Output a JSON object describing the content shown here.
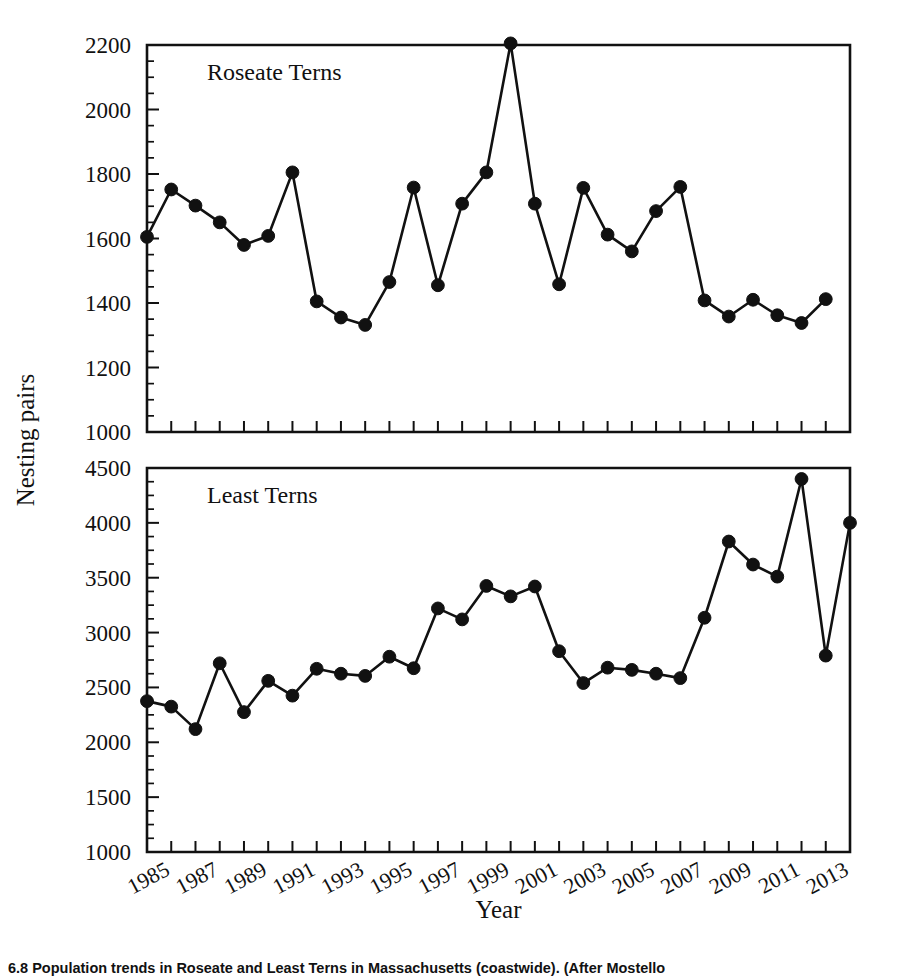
{
  "figure": {
    "xlabel": "Year",
    "ylabel": "Nesting pairs",
    "caption": "6.8   Population trends in Roseate and Least Terns in Massachusetts (coastwide). (After Mostello"
  },
  "chart_data": [
    {
      "type": "line",
      "title": "Roseate Terns",
      "xlabel": "Year",
      "ylabel": "Nesting pairs",
      "xlim": [
        1984,
        2013
      ],
      "ylim": [
        1000,
        2200
      ],
      "ytick_step": 200,
      "yticks": [
        1000,
        1200,
        1400,
        1600,
        1800,
        2000,
        2200
      ],
      "xticks": [
        1985,
        1987,
        1989,
        1991,
        1993,
        1995,
        1997,
        1999,
        2001,
        2003,
        2005,
        2007,
        2009,
        2011,
        2013
      ],
      "grid": false,
      "legend": "none",
      "marker": "filled-circle",
      "x": [
        1984,
        1985,
        1986,
        1987,
        1988,
        1989,
        1990,
        1991,
        1992,
        1993,
        1994,
        1995,
        1996,
        1997,
        1998,
        1999,
        2000,
        2001,
        2002,
        2003,
        2004,
        2005,
        2006,
        2007,
        2008,
        2009,
        2010,
        2011,
        2012,
        2013
      ],
      "values": [
        1605,
        1752,
        1702,
        1650,
        1580,
        1608,
        1805,
        1405,
        1355,
        1332,
        1465,
        1758,
        1455,
        1708,
        1805,
        2205,
        1708,
        1458,
        1757,
        1612,
        1560,
        1685,
        1760,
        1408,
        1358,
        1410,
        1362,
        1338,
        1412,
        null
      ]
    },
    {
      "type": "line",
      "title": "Least Terns",
      "xlabel": "Year",
      "ylabel": "Nesting pairs",
      "xlim": [
        1984,
        2013
      ],
      "ylim": [
        1000,
        4500
      ],
      "ytick_step": 500,
      "yticks": [
        1000,
        1500,
        2000,
        2500,
        3000,
        3500,
        4000,
        4500
      ],
      "xticks": [
        1985,
        1987,
        1989,
        1991,
        1993,
        1995,
        1997,
        1999,
        2001,
        2003,
        2005,
        2007,
        2009,
        2011,
        2013
      ],
      "grid": false,
      "legend": "none",
      "marker": "filled-circle",
      "x": [
        1984,
        1985,
        1986,
        1987,
        1988,
        1989,
        1990,
        1991,
        1992,
        1993,
        1994,
        1995,
        1996,
        1997,
        1998,
        1999,
        2000,
        2001,
        2002,
        2003,
        2004,
        2005,
        2006,
        2007,
        2008,
        2009,
        2010,
        2011,
        2012,
        2013
      ],
      "values": [
        2375,
        2325,
        2120,
        2720,
        2275,
        2560,
        2425,
        2670,
        2625,
        2605,
        2780,
        2675,
        3220,
        3120,
        3425,
        3330,
        3420,
        2830,
        2540,
        2680,
        2660,
        2625,
        2585,
        3135,
        3830,
        3620,
        3510,
        4400,
        2790,
        4000
      ]
    }
  ]
}
